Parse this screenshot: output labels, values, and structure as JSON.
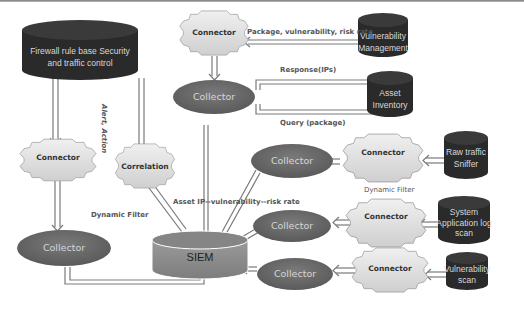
{
  "diagram": {
    "nodes": {
      "firewall": {
        "label_line1": "Firewall rule base Security",
        "label_line2": "and  traffic control",
        "shape": "database"
      },
      "vuln_mgmt": {
        "label_line1": "Vulnerability",
        "label_line2": "Management",
        "shape": "database"
      },
      "asset_inventory": {
        "label_line1": "Asset",
        "label_line2": "Inventory",
        "shape": "database"
      },
      "raw_traffic": {
        "label_line1": "Raw  traffic",
        "label_line2": "Sniffer",
        "shape": "database"
      },
      "system_app_log": {
        "label_line1": "System",
        "label_line2": "Application log",
        "label_line3": "scan",
        "shape": "database"
      },
      "vuln_scan": {
        "label_line1": "Vulnerability",
        "label_line2": "scan",
        "shape": "database"
      },
      "connector_top": {
        "label": "Connector",
        "shape": "cog"
      },
      "connector_left": {
        "label": "Connector",
        "shape": "cog"
      },
      "correlation": {
        "label": "Correlation",
        "shape": "cog"
      },
      "connector_r1": {
        "label": "Connector",
        "shape": "cog"
      },
      "connector_r2": {
        "label": "Connector",
        "shape": "cog"
      },
      "connector_r3": {
        "label": "Connector",
        "shape": "cog"
      },
      "collector_top": {
        "label": "Collector",
        "shape": "ellipse"
      },
      "collector_left": {
        "label": "Collector",
        "shape": "ellipse"
      },
      "collector_r1": {
        "label": "Collector",
        "shape": "ellipse"
      },
      "collector_r2": {
        "label": "Collector",
        "shape": "ellipse"
      },
      "collector_r3": {
        "label": "Collector",
        "shape": "ellipse"
      },
      "siem": {
        "label": "SIEM",
        "shape": "cylinder"
      }
    },
    "edge_labels": {
      "package_vuln_risk": "Package, vulnerability, risk rate",
      "response_ips": "Response(IPs)",
      "query_package": "Query (package)",
      "alert_action": "Alert, Action",
      "dynamic_filter_left": "Dynamic Filter",
      "dynamic_filter_right": "Dynamic Filter",
      "asset_ip_vuln_risk": "Asset  IP--vulnerability--risk rate"
    },
    "colors": {
      "database_fill": "#2b2b2b",
      "collector_fill": "#6b6b6b",
      "connector_fill": "#e2e2e2",
      "siem_fill": "#8a8a8a",
      "arrow_stroke": "#777777"
    }
  }
}
